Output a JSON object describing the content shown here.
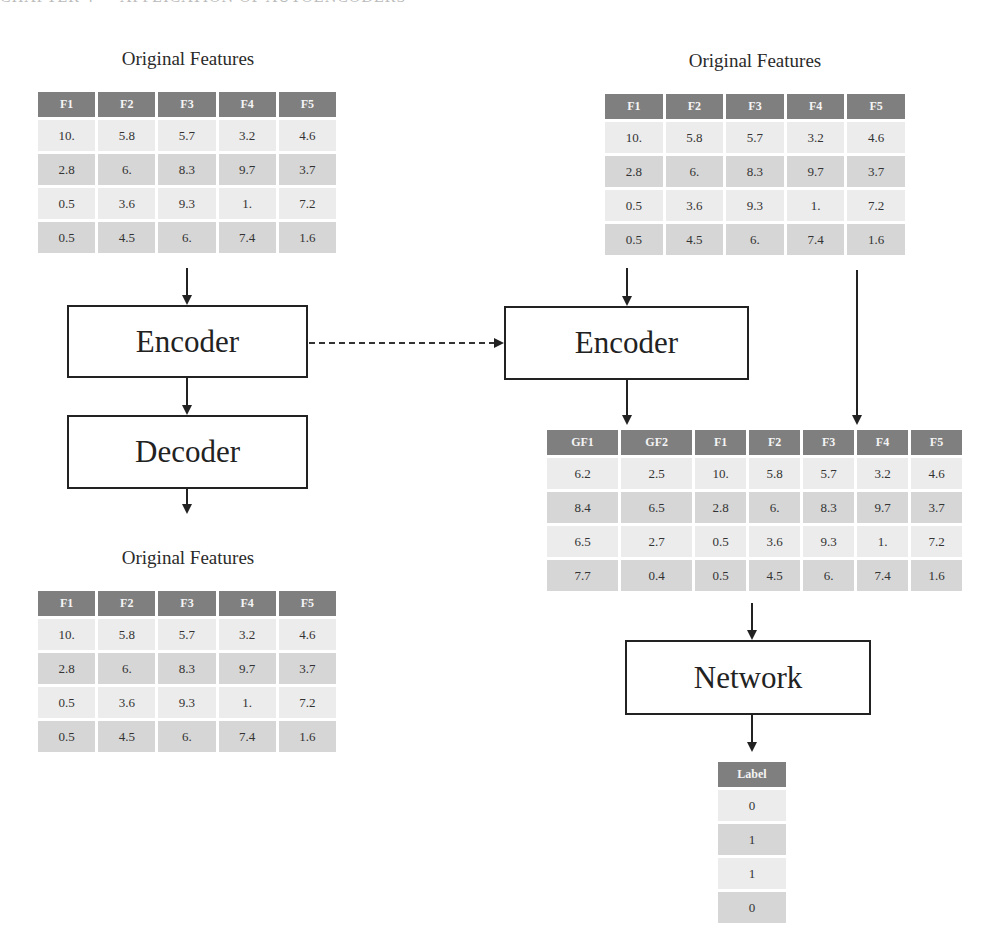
{
  "running_header": "CHAPTER 4 — APPLICATION OF AUTOENCODERS",
  "left": {
    "input_table": {
      "caption": "Original Features",
      "columns": [
        "F1",
        "F2",
        "F3",
        "F4",
        "F5"
      ],
      "rows": [
        [
          "10.",
          "5.8",
          "5.7",
          "3.2",
          "4.6"
        ],
        [
          "2.8",
          "6.",
          "8.3",
          "9.7",
          "3.7"
        ],
        [
          "0.5",
          "3.6",
          "9.3",
          "1.",
          "7.2"
        ],
        [
          "0.5",
          "4.5",
          "6.",
          "7.4",
          "1.6"
        ]
      ]
    },
    "encoder_label": "Encoder",
    "decoder_label": "Decoder",
    "output_table": {
      "caption": "Original Features",
      "columns": [
        "F1",
        "F2",
        "F3",
        "F4",
        "F5"
      ],
      "rows": [
        [
          "10.",
          "5.8",
          "5.7",
          "3.2",
          "4.6"
        ],
        [
          "2.8",
          "6.",
          "8.3",
          "9.7",
          "3.7"
        ],
        [
          "0.5",
          "3.6",
          "9.3",
          "1.",
          "7.2"
        ],
        [
          "0.5",
          "4.5",
          "6.",
          "7.4",
          "1.6"
        ]
      ]
    }
  },
  "right": {
    "input_table": {
      "caption": "Original Features",
      "columns": [
        "F1",
        "F2",
        "F3",
        "F4",
        "F5"
      ],
      "rows": [
        [
          "10.",
          "5.8",
          "5.7",
          "3.2",
          "4.6"
        ],
        [
          "2.8",
          "6.",
          "8.3",
          "9.7",
          "3.7"
        ],
        [
          "0.5",
          "3.6",
          "9.3",
          "1.",
          "7.2"
        ],
        [
          "0.5",
          "4.5",
          "6.",
          "7.4",
          "1.6"
        ]
      ]
    },
    "encoder_label": "Encoder",
    "combined_table": {
      "columns": [
        "GF1",
        "GF2",
        "F1",
        "F2",
        "F3",
        "F4",
        "F5"
      ],
      "rows": [
        [
          "6.2",
          "2.5",
          "10.",
          "5.8",
          "5.7",
          "3.2",
          "4.6"
        ],
        [
          "8.4",
          "6.5",
          "2.8",
          "6.",
          "8.3",
          "9.7",
          "3.7"
        ],
        [
          "6.5",
          "2.7",
          "0.5",
          "3.6",
          "9.3",
          "1.",
          "7.2"
        ],
        [
          "7.7",
          "0.4",
          "0.5",
          "4.5",
          "6.",
          "7.4",
          "1.6"
        ]
      ]
    },
    "network_label": "Network",
    "label_table": {
      "columns": [
        "Label"
      ],
      "rows": [
        [
          "0"
        ],
        [
          "1"
        ],
        [
          "1"
        ],
        [
          "0"
        ]
      ]
    }
  },
  "colors": {
    "header_bg": "#7f7f7f",
    "row_dark": "#d6d6d6",
    "row_light": "#ececec",
    "stroke": "#222222"
  }
}
